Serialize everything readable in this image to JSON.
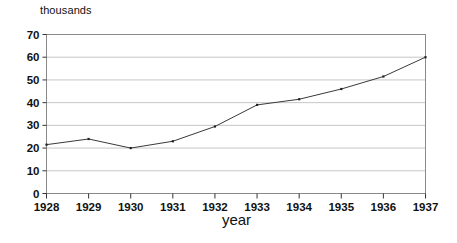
{
  "chart_data": {
    "type": "line",
    "title": "",
    "subtitle": "",
    "xlabel": "year",
    "ylabel": "thousands",
    "categories": [
      "1928",
      "1929",
      "1930",
      "1931",
      "1932",
      "1933",
      "1934",
      "1935",
      "1936",
      "1937"
    ],
    "x": [
      1928,
      1929,
      1930,
      1931,
      1932,
      1933,
      1934,
      1935,
      1936,
      1937
    ],
    "values": [
      21.5,
      24,
      20,
      23,
      29.5,
      39,
      41.5,
      46,
      51.5,
      60
    ],
    "series": [
      {
        "name": "",
        "values": [
          21.5,
          24,
          20,
          23,
          29.5,
          39,
          41.5,
          46,
          51.5,
          60
        ]
      }
    ],
    "xlim": [
      1928,
      1937
    ],
    "ylim": [
      0,
      70
    ],
    "yticks": [
      0,
      10,
      20,
      30,
      40,
      50,
      60,
      70
    ],
    "ytick_labels": [
      "0",
      "10",
      "20",
      "30",
      "40",
      "50",
      "60",
      "70"
    ],
    "xticks": [
      1928,
      1929,
      1930,
      1931,
      1932,
      1933,
      1934,
      1935,
      1936,
      1937
    ],
    "xtick_labels": [
      "1928",
      "1929",
      "1930",
      "1931",
      "1932",
      "1933",
      "1934",
      "1935",
      "1936",
      "1937"
    ],
    "grid": "horizontal",
    "legend": "none",
    "markers": "small-dot",
    "annotations": [],
    "colors": {
      "line": "#3a3a3a",
      "marker": "#222222",
      "grid": "#b8b8b8",
      "axis": "#8a8a8a",
      "background": "#ffffff",
      "text": "#111111"
    }
  },
  "axes": {
    "y_caption": "thousands",
    "x_caption": "year"
  }
}
